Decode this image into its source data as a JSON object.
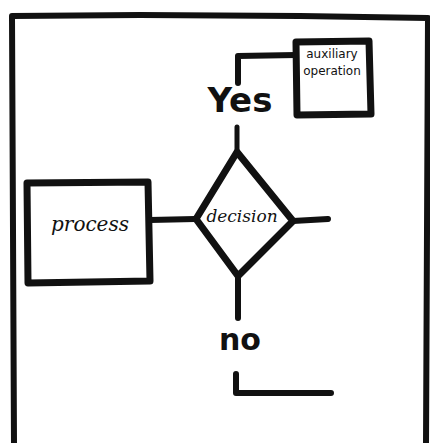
{
  "diagram": {
    "type": "hand-drawn flowchart",
    "colors": {
      "ink": "#111111",
      "background": "#ffffff"
    },
    "nodes": {
      "process": {
        "shape": "rectangle",
        "label": "process"
      },
      "decision": {
        "shape": "diamond",
        "label": "decision"
      },
      "auxiliary": {
        "shape": "rectangle",
        "label_line1": "auxiliary",
        "label_line2": "operation"
      }
    },
    "branches": {
      "yes": {
        "label": "Yes",
        "target": "auxiliary operation"
      },
      "no": {
        "label": "no",
        "target": "continues (open end)"
      }
    },
    "edges": [
      {
        "from": "process",
        "to": "decision"
      },
      {
        "from": "decision",
        "to": "auxiliary",
        "label": "Yes"
      },
      {
        "from": "decision",
        "to": "open-end-right"
      },
      {
        "from": "decision",
        "to": "open-end-bottom",
        "label": "no"
      }
    ]
  }
}
